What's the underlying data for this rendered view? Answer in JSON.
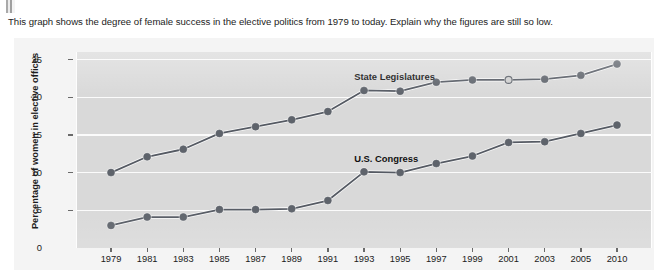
{
  "prompt": {
    "text": "This graph shows the degree of female success in the elective politics from 1979 to today. Explain why the figures are still so low."
  },
  "chart_data": {
    "type": "line",
    "title": "",
    "xlabel": "",
    "ylabel": "Percentage of women in elective offices",
    "categories": [
      "1979",
      "1981",
      "1983",
      "1985",
      "1987",
      "1989",
      "1991",
      "1993",
      "1995",
      "1997",
      "1999",
      "2001",
      "2003",
      "2005",
      "2010"
    ],
    "ylim": [
      0,
      26
    ],
    "yticks": [
      0,
      5,
      10,
      15,
      20,
      25
    ],
    "grid": true,
    "legend_position": "inline-annotations",
    "series": [
      {
        "name": "State Legislatures",
        "color": "#555a63",
        "values": [
          10.0,
          12.1,
          13.1,
          15.2,
          16.1,
          17.0,
          18.1,
          20.9,
          20.8,
          22.0,
          22.3,
          22.3,
          22.4,
          22.9,
          24.4
        ]
      },
      {
        "name": "U.S. Congress",
        "color": "#555a63",
        "values": [
          3.0,
          4.1,
          4.1,
          5.1,
          5.1,
          5.2,
          6.3,
          10.1,
          10.0,
          11.2,
          12.2,
          14.0,
          14.1,
          15.2,
          16.3
        ]
      }
    ],
    "annotations": [
      {
        "name": "state-legislatures-label",
        "text": "State Legislatures"
      },
      {
        "name": "us-congress-label",
        "text": "U.S. Congress"
      }
    ]
  },
  "colors": {
    "plot_background": "#d9d9d9",
    "panel_background": "#f4f4f4",
    "gridline": "#fbfbfb",
    "marker": "#5e636b",
    "line": "#4c515a",
    "text": "#1b1b1b"
  }
}
